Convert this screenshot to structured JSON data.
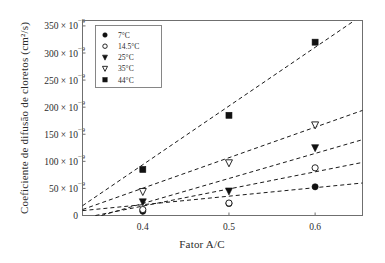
{
  "chart_data": {
    "type": "scatter",
    "title": "",
    "xlabel": "Fator A/C",
    "ylabel": "Coeficiente de difusão de cloretos (cm²/s)",
    "x": [
      0.4,
      0.5,
      0.6
    ],
    "xlim": [
      0.33,
      0.655
    ],
    "ylim": [
      0,
      3.6e-07
    ],
    "grid": false,
    "legend_position": "top-left",
    "xticks": [
      "0.4",
      "0.5",
      "0.6"
    ],
    "xtick_values": [
      0.4,
      0.5,
      0.6
    ],
    "yticks": [
      {
        "value": 0,
        "mantissa": "0",
        "times": "",
        "base": "",
        "exp": ""
      },
      {
        "value": 5e-08,
        "mantissa": "50",
        "times": "×",
        "base": "10",
        "exp": "-9"
      },
      {
        "value": 1e-07,
        "mantissa": "100",
        "times": "×",
        "base": "10",
        "exp": "-9"
      },
      {
        "value": 1.5e-07,
        "mantissa": "150",
        "times": "×",
        "base": "10",
        "exp": "-9"
      },
      {
        "value": 2e-07,
        "mantissa": "200",
        "times": "×",
        "base": "10",
        "exp": "-9"
      },
      {
        "value": 2.5e-07,
        "mantissa": "250",
        "times": "×",
        "base": "10",
        "exp": "-9"
      },
      {
        "value": 3e-07,
        "mantissa": "300",
        "times": "×",
        "base": "10",
        "exp": "-9"
      },
      {
        "value": 3.5e-07,
        "mantissa": "350",
        "times": "×",
        "base": "10",
        "exp": "-9"
      }
    ],
    "series": [
      {
        "name": "7°C",
        "label": "7°C",
        "marker": "filled-circle",
        "color": "#111111",
        "x": [
          0.4,
          0.5,
          0.6
        ],
        "values": [
          8e-09,
          2.2e-08,
          5.3e-08
        ],
        "fit": {
          "x0": 0.33,
          "y0": 9e-09,
          "x1": 0.655,
          "y1": 6e-08
        }
      },
      {
        "name": "14.5°C",
        "label": "14.5°C",
        "marker": "open-circle",
        "color": "#111111",
        "x": [
          0.4,
          0.5,
          0.6
        ],
        "values": [
          1.1e-08,
          2.3e-08,
          8.8e-08
        ],
        "fit": {
          "x0": 0.345,
          "y0": 0,
          "x1": 0.655,
          "y1": 9.8e-08
        }
      },
      {
        "name": "25°C",
        "label": "25°C",
        "marker": "filled-triangle-down",
        "color": "#111111",
        "x": [
          0.4,
          0.5,
          0.6
        ],
        "values": [
          2.5e-08,
          4.5e-08,
          1.25e-07
        ],
        "fit": {
          "x0": 0.352,
          "y0": 0,
          "x1": 0.655,
          "y1": 1.4e-07
        }
      },
      {
        "name": "35°C",
        "label": "35°C",
        "marker": "open-triangle-down",
        "color": "#111111",
        "x": [
          0.4,
          0.5,
          0.6
        ],
        "values": [
          4.4e-08,
          9.7e-08,
          1.67e-07
        ],
        "fit": {
          "x0": 0.33,
          "y0": 1.1e-08,
          "x1": 0.655,
          "y1": 1.94e-07
        }
      },
      {
        "name": "44°C",
        "label": "44°C",
        "marker": "filled-square",
        "color": "#111111",
        "x": [
          0.4,
          0.5,
          0.6
        ],
        "values": [
          8.5e-08,
          1.85e-07,
          3.2e-07
        ],
        "fit": {
          "x0": 0.33,
          "y0": 1.8e-08,
          "x1": 0.655,
          "y1": 3.7e-07
        }
      }
    ]
  },
  "legend": {
    "entries": [
      "7°C",
      "14.5°C",
      "25°C",
      "35°C",
      "44°C"
    ]
  },
  "axes": {
    "x_title": "Fator A/C",
    "y_title": "Coeficiente de difusão de cloretos (cm²/s)"
  },
  "colors": {
    "ink": "#111111",
    "frame": "#6f6f6f",
    "background": "#ffffff"
  }
}
